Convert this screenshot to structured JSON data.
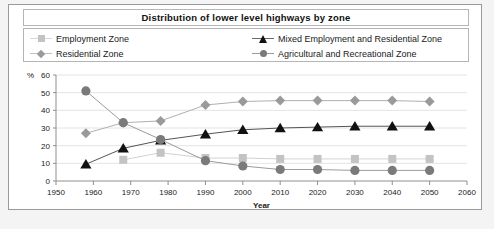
{
  "chart_data": {
    "type": "line",
    "title": "Distribution of lower level highways by zone",
    "xlabel": "Year",
    "ylabel": "%",
    "unit_label": "%",
    "xlim": [
      1950,
      2060
    ],
    "ylim": [
      0,
      60
    ],
    "x_ticks": [
      1950,
      1960,
      1970,
      1980,
      1990,
      2000,
      2010,
      2020,
      2030,
      2040,
      2050,
      2060
    ],
    "y_ticks": [
      0,
      10,
      20,
      30,
      40,
      50,
      60
    ],
    "grid": true,
    "legend_position": "top",
    "x": [
      1958,
      1968,
      1978,
      1990,
      2000,
      2010,
      2020,
      2030,
      2040,
      2050
    ],
    "series": [
      {
        "name": "Employment Zone",
        "marker": "square",
        "color": "#c3c3c3",
        "line_color": "#d2d2d2",
        "values": [
          null,
          12,
          16,
          13,
          13,
          12.5,
          12.5,
          12.5,
          12.5,
          12.5
        ]
      },
      {
        "name": "Residential Zone",
        "marker": "diamond",
        "color": "#9a9a9a",
        "line_color": "#b0b0b0",
        "values": [
          27,
          33,
          34,
          43,
          45,
          45.5,
          45.5,
          45.5,
          45.5,
          45
        ]
      },
      {
        "name": "Mixed Employment and Residential Zone",
        "marker": "triangle",
        "color": "#111111",
        "line_color": "#555555",
        "values": [
          9.5,
          18.5,
          23,
          26.5,
          29,
          30,
          30.5,
          31,
          31,
          31
        ]
      },
      {
        "name": "Agricultural and Recreational Zone",
        "marker": "circle",
        "color": "#7a7a7a",
        "line_color": "#9b9b9b",
        "values": [
          51,
          33,
          23.5,
          11.5,
          8.5,
          6.5,
          6.5,
          6,
          6,
          6
        ]
      }
    ]
  },
  "legend": {
    "left": [
      {
        "label": "Employment Zone",
        "marker": "square",
        "color": "#c3c3c3",
        "line_color": "#d8d8d8"
      },
      {
        "label": "Residential Zone",
        "marker": "diamond",
        "color": "#9a9a9a",
        "line_color": "#c0c0c0"
      }
    ],
    "right": [
      {
        "label": "Mixed Employment and Residential Zone",
        "marker": "triangle",
        "color": "#111111",
        "line_color": "#6a6a6a"
      },
      {
        "label": "Agricultural and Recreational Zone",
        "marker": "circle",
        "color": "#7a7a7a",
        "line_color": "#9b9b9b"
      }
    ]
  }
}
